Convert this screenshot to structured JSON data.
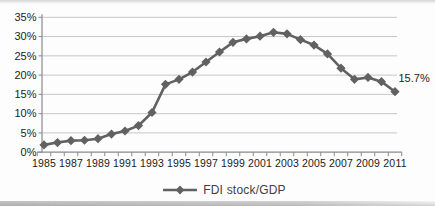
{
  "chart_data": {
    "type": "line",
    "title": "",
    "x": [
      1985,
      1986,
      1987,
      1988,
      1989,
      1990,
      1991,
      1992,
      1993,
      1994,
      1995,
      1996,
      1997,
      1998,
      1999,
      2000,
      2001,
      2002,
      2003,
      2004,
      2005,
      2006,
      2007,
      2008,
      2009,
      2010,
      2011
    ],
    "x_tick_labels": [
      "1985",
      "1987",
      "1989",
      "1991",
      "1993",
      "1995",
      "1997",
      "1999",
      "2001",
      "2003",
      "2005",
      "2007",
      "2009",
      "2011"
    ],
    "series": [
      {
        "name": "FDI stock/GDP",
        "values": [
          1.9,
          2.5,
          3.0,
          3.1,
          3.5,
          4.7,
          5.5,
          6.9,
          10.3,
          17.6,
          18.9,
          20.8,
          23.4,
          26.0,
          28.5,
          29.4,
          30.1,
          31.1,
          30.7,
          29.2,
          27.8,
          25.5,
          21.8,
          18.9,
          19.4,
          18.3,
          15.7
        ]
      }
    ],
    "ylim": [
      0,
      35
    ],
    "y_ticks": [
      0,
      5,
      10,
      15,
      20,
      25,
      30,
      35
    ],
    "y_tick_labels": [
      "0%",
      "5%",
      "10%",
      "15%",
      "20%",
      "25%",
      "30%",
      "35%"
    ],
    "annotation": {
      "text": "15.7%",
      "year": 2011,
      "value": 15.7
    },
    "legend": {
      "position": "bottom",
      "entries": [
        "FDI stock/GDP"
      ]
    },
    "grid": "horizontal",
    "colors": {
      "series": "#616161",
      "gridline": "#c6c6c6",
      "axis": "#8a8a8a",
      "text": "#1c1c1c"
    }
  }
}
